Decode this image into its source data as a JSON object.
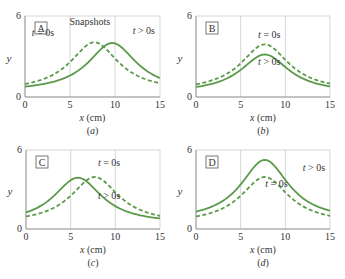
{
  "figure": {
    "title": "Snapshots",
    "colors": {
      "curve": "#5a9a4a",
      "axis": "#9a9a9a",
      "grid": "#cccccc",
      "text": "#333333"
    },
    "axes": {
      "xlabel": "x (cm)",
      "ylabel": "y",
      "xticks": [
        "0",
        "5",
        "10",
        "15"
      ],
      "yticks": [
        "0",
        "6"
      ],
      "xlim": [
        0,
        15
      ],
      "ylim": [
        0,
        6
      ]
    }
  },
  "panels": [
    {
      "id": "a",
      "box_label": "A",
      "caption": "(a)",
      "show_title": true,
      "labels": [
        {
          "text": "t = 0s",
          "x": 2.0,
          "y": 4.5
        },
        {
          "text": "t > 0s",
          "x": 13.2,
          "y": 4.7
        }
      ]
    },
    {
      "id": "b",
      "box_label": "B",
      "caption": "(b)",
      "show_title": false,
      "labels": [
        {
          "text": "t = 0s",
          "x": 8.2,
          "y": 4.4
        },
        {
          "text": "t > 0s",
          "x": 8.2,
          "y": 2.4
        }
      ]
    },
    {
      "id": "c",
      "box_label": "C",
      "caption": "(c)",
      "show_title": false,
      "labels": [
        {
          "text": "t = 0s",
          "x": 9.3,
          "y": 4.8
        },
        {
          "text": "t > 0s",
          "x": 9.3,
          "y": 2.3
        }
      ]
    },
    {
      "id": "d",
      "box_label": "D",
      "caption": "(d)",
      "show_title": false,
      "labels": [
        {
          "text": "t > 0s",
          "x": 13.2,
          "y": 4.4
        },
        {
          "text": "t = 0s",
          "x": 9.0,
          "y": 3.2
        }
      ]
    }
  ],
  "chart_data": [
    {
      "type": "line",
      "title": "Snapshots",
      "panel": "A",
      "xlabel": "x (cm)",
      "ylabel": "y",
      "xlim": [
        0,
        15
      ],
      "ylim": [
        0,
        6
      ],
      "series": [
        {
          "name": "t = 0s",
          "style": "dashed",
          "peak_x": 7.7,
          "peak_y": 4.05,
          "width": 3.3,
          "baseline": 0.4
        },
        {
          "name": "t > 0s",
          "style": "solid",
          "peak_x": 9.7,
          "peak_y": 4.0,
          "width": 3.3,
          "baseline": 0.4
        }
      ]
    },
    {
      "type": "line",
      "panel": "B",
      "xlabel": "x (cm)",
      "ylabel": "y",
      "xlim": [
        0,
        15
      ],
      "ylim": [
        0,
        6
      ],
      "series": [
        {
          "name": "t = 0s",
          "style": "dashed",
          "peak_x": 7.7,
          "peak_y": 3.9,
          "width": 3.3,
          "baseline": 0.4
        },
        {
          "name": "t > 0s",
          "style": "solid",
          "peak_x": 7.7,
          "peak_y": 3.15,
          "width": 3.3,
          "baseline": 0.3
        }
      ]
    },
    {
      "type": "line",
      "panel": "C",
      "xlabel": "x (cm)",
      "ylabel": "y",
      "xlim": [
        0,
        15
      ],
      "ylim": [
        0,
        6
      ],
      "series": [
        {
          "name": "t = 0s",
          "style": "dashed",
          "peak_x": 7.7,
          "peak_y": 3.95,
          "width": 3.3,
          "baseline": 0.4
        },
        {
          "name": "t > 0s",
          "style": "solid",
          "peak_x": 5.8,
          "peak_y": 3.9,
          "width": 3.3,
          "baseline": 0.4
        }
      ]
    },
    {
      "type": "line",
      "panel": "D",
      "xlabel": "x (cm)",
      "ylabel": "y",
      "xlim": [
        0,
        15
      ],
      "ylim": [
        0,
        6
      ],
      "series": [
        {
          "name": "t = 0s",
          "style": "dashed",
          "peak_x": 7.7,
          "peak_y": 3.95,
          "width": 3.3,
          "baseline": 0.4
        },
        {
          "name": "t > 0s",
          "style": "solid",
          "peak_x": 7.7,
          "peak_y": 5.25,
          "width": 3.3,
          "baseline": 0.6
        }
      ]
    }
  ]
}
